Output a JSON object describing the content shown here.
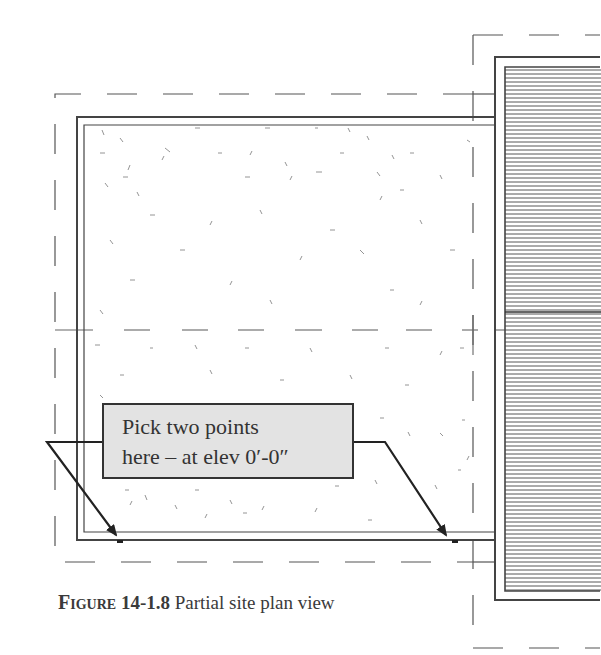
{
  "figure": {
    "caption": {
      "label": "Figure",
      "number": "14-1.8",
      "text": "Partial site plan view"
    },
    "callout": {
      "line1": "Pick two points",
      "line2": "here – at elev 0′-0″"
    },
    "elements": {
      "site_boundary": "dashed property line",
      "slab": "concrete slab with stipple hatch",
      "building": "adjacent building with horizontal line hatch",
      "centerline": "dashed horizontal reference line",
      "pick_points": 2
    },
    "colors": {
      "line": "#444444",
      "callout_fill": "#e3e3e3",
      "callout_border": "#333333",
      "text": "#333333"
    }
  }
}
